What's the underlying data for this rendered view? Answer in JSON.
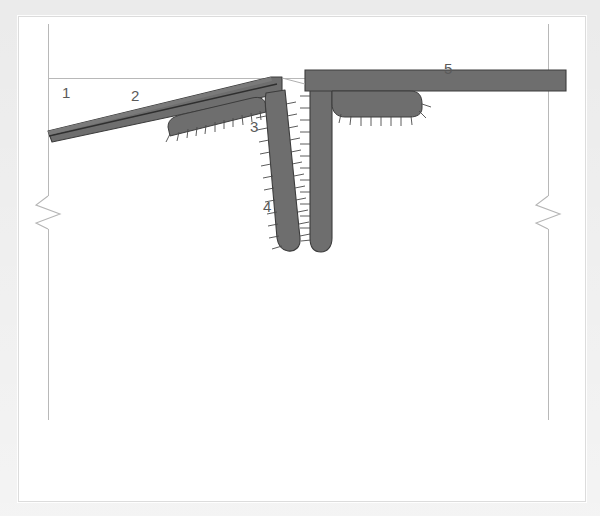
{
  "figure": {
    "background_color": "#e8e8e8",
    "plate_color": "#ffffff",
    "plate_border_color": "#dcdcdc"
  },
  "style": {
    "member_fill": "#6e6e6e",
    "member_stroke": "#3c3c3c",
    "thin_line": "#b0b0b0",
    "hatch_stroke": "#4a4a4a",
    "label_color": "#5a5a5a",
    "break_line_color": "#b5b5b5"
  },
  "callouts": [
    {
      "id": "callout-1",
      "text": "1",
      "x": 62,
      "y": 85
    },
    {
      "id": "callout-2",
      "text": "2",
      "x": 131,
      "y": 88
    },
    {
      "id": "callout-3",
      "text": "3",
      "x": 250,
      "y": 119
    },
    {
      "id": "callout-4",
      "text": "4",
      "x": 263,
      "y": 199
    },
    {
      "id": "callout-5",
      "text": "5",
      "x": 444,
      "y": 61
    }
  ],
  "guides": {
    "left_vertical_x": 48,
    "right_vertical_x": 548,
    "datum_line_y": 78,
    "vertical_top_y": 24,
    "vertical_bottom_y": 420
  },
  "break_symbols": [
    {
      "id": "break-left",
      "x": 48,
      "y": 212
    },
    {
      "id": "break-right",
      "x": 548,
      "y": 212
    }
  ],
  "members": [
    {
      "id": "sloped-panel",
      "name": "sloped panel",
      "description": "inclined layered member rising from lower left to the fin junction"
    },
    {
      "id": "left-fin",
      "name": "left fin",
      "description": "downward tapering rib with edge hatching"
    },
    {
      "id": "right-fin",
      "name": "right fin",
      "description": "downward rib with edge hatching"
    },
    {
      "id": "horizontal-panel",
      "name": "horizontal panel",
      "description": "right-hand horizontal slab extending past the break line"
    }
  ]
}
